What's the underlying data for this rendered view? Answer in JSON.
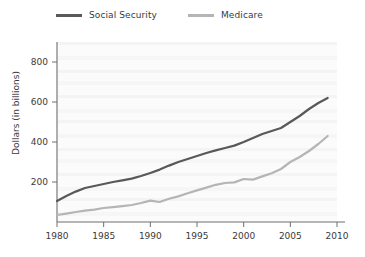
{
  "chart_data": {
    "type": "line",
    "title": "",
    "subtitle": "",
    "xlabel": "",
    "ylabel": "Dollars (in billions)",
    "xlim": [
      1980,
      2010
    ],
    "ylim": [
      0,
      900
    ],
    "yticks": [
      200,
      400,
      600,
      800
    ],
    "ytick_labels": [
      "200",
      "400",
      "600",
      "800"
    ],
    "xticks": [
      1980,
      1985,
      1990,
      1995,
      2000,
      2005,
      2010
    ],
    "xtick_labels": [
      "1980",
      "1985",
      "1990",
      "1995",
      "2000",
      "2005",
      "2010"
    ],
    "grid": false,
    "legend_position": "top",
    "x": [
      1980,
      1981,
      1982,
      1983,
      1984,
      1985,
      1986,
      1987,
      1988,
      1989,
      1990,
      1991,
      1992,
      1993,
      1994,
      1995,
      1996,
      1997,
      1998,
      1999,
      2000,
      2001,
      2002,
      2003,
      2004,
      2005,
      2006,
      2007,
      2008,
      2009
    ],
    "series": [
      {
        "name": "Social Security",
        "color": "#595959",
        "values": [
          105,
          130,
          152,
          170,
          180,
          190,
          200,
          208,
          217,
          230,
          245,
          262,
          282,
          300,
          315,
          330,
          345,
          358,
          370,
          382,
          400,
          420,
          440,
          455,
          470,
          500,
          530,
          565,
          595,
          620
        ]
      },
      {
        "name": "Medicare",
        "color": "#b5b5b5",
        "values": [
          35,
          42,
          50,
          57,
          62,
          70,
          74,
          79,
          85,
          95,
          107,
          100,
          116,
          128,
          144,
          158,
          172,
          186,
          195,
          198,
          215,
          212,
          228,
          244,
          265,
          300,
          325,
          355,
          390,
          430
        ]
      }
    ]
  },
  "legend": {
    "items": [
      {
        "label": "Social Security",
        "color": "#595959"
      },
      {
        "label": "Medicare",
        "color": "#b5b5b5"
      }
    ]
  },
  "axes": {
    "y_axis_title": "Dollars (in billions)"
  }
}
